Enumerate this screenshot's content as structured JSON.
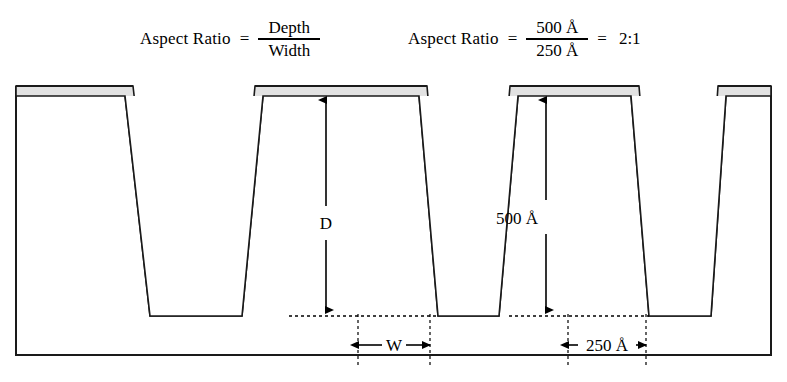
{
  "formulas": [
    {
      "label": "Aspect Ratio",
      "equals": "=",
      "numerator": "Depth",
      "denominator": "Width",
      "result": "",
      "result_equals": ""
    },
    {
      "label": "Aspect Ratio",
      "equals": "=",
      "numerator": "500 Å",
      "denominator": "250 Å",
      "result_equals": "=",
      "result": "2:1"
    }
  ],
  "diagram": {
    "type": "trench-cross-section",
    "depth_label": "D",
    "depth_value_label": "500 Å",
    "width_label": "W",
    "width_value_label": "250 Å",
    "colors": {
      "film_layer": "#e2e2e2",
      "outline": "#1a1a1a",
      "substrate_background": "#ffffff",
      "dimension_line": "#000000"
    },
    "features": {
      "trench_count": 3,
      "mesa_count": 4,
      "sidewall_profile": "tapered",
      "film_conformal": true
    }
  }
}
